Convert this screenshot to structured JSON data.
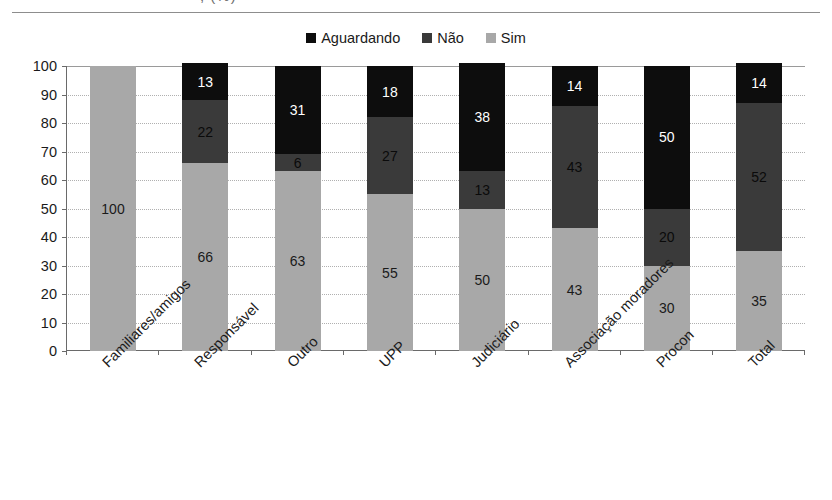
{
  "title_remnant": ", (%)",
  "legend": {
    "position": "top-center",
    "items": [
      {
        "label": "Aguardando",
        "color": "#0d0d0d"
      },
      {
        "label": "Não",
        "color": "#3a3a3a"
      },
      {
        "label": "Sim",
        "color": "#a8a8a8"
      }
    ]
  },
  "axes": {
    "y_ticks": [
      "100",
      "90",
      "80",
      "70",
      "60",
      "50",
      "40",
      "30",
      "20",
      "10",
      "0"
    ],
    "ylim": [
      0,
      100
    ],
    "ylabel": "",
    "xlabel": ""
  },
  "chart_data": {
    "type": "bar",
    "subtype": "stacked-bar-100",
    "title": "",
    "xlabel": "",
    "ylabel": "",
    "ylim": [
      0,
      100
    ],
    "ytick_step": 10,
    "grid": true,
    "legend_position": "top-center",
    "categories": [
      "Familiares/amigos",
      "Responsável",
      "Outro",
      "UPP",
      "Judiciário",
      "Associação moradores",
      "Procon",
      "Total"
    ],
    "series": [
      {
        "name": "Sim",
        "color": "#a8a8a8",
        "values": [
          100,
          66,
          63,
          55,
          50,
          43,
          30,
          35
        ]
      },
      {
        "name": "Não",
        "color": "#3a3a3a",
        "values": [
          null,
          22,
          6,
          27,
          13,
          43,
          20,
          52
        ]
      },
      {
        "name": "Aguardando",
        "color": "#0d0d0d",
        "values": [
          null,
          13,
          31,
          18,
          38,
          14,
          50,
          14
        ]
      }
    ]
  }
}
